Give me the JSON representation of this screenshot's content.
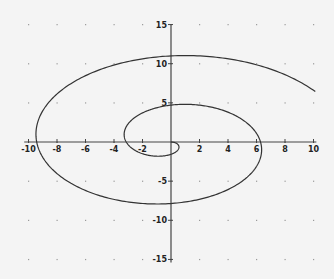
{
  "chart_data": {
    "type": "line",
    "title": "",
    "xlabel": "",
    "ylabel": "",
    "xlim": [
      -10,
      10
    ],
    "ylim": [
      -15,
      15
    ],
    "x_ticks": [
      -10,
      -8,
      -6,
      -4,
      -2,
      2,
      4,
      6,
      8,
      10
    ],
    "y_ticks": [
      15,
      10,
      5,
      -5,
      -10,
      -15
    ],
    "grid": "dotted points at tick intersections",
    "series": [
      {
        "name": "spiral",
        "parametric": "x = t·cos(t), y = t·sin(t)",
        "t_range": [
          0,
          12.0
        ],
        "key_points": [
          {
            "x": 0,
            "y": 0
          },
          {
            "x": -3.14,
            "y": 0
          },
          {
            "x": 0,
            "y": -4.7
          },
          {
            "x": 6.28,
            "y": 0
          },
          {
            "x": 0,
            "y": 7.85
          },
          {
            "x": -9.42,
            "y": 0
          },
          {
            "x": 0,
            "y": -11.0
          },
          {
            "x": 10.1,
            "y": -6.5
          }
        ]
      }
    ],
    "colors": {
      "curve": "#333333",
      "axes": "#444444",
      "background": "#f4f4f4",
      "grid_dots": "#9a9a9a"
    }
  }
}
